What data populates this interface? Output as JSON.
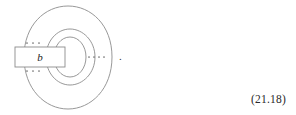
{
  "figure": {
    "kind": "knot-diagram",
    "box": {
      "label": "b",
      "dots_above": "· · ·",
      "dots_below": "· · ·"
    },
    "interior_dots": "· · · ·",
    "trailing_punctuation": ".",
    "loop_count": 3,
    "colors": {
      "background": "#ffffff",
      "stroke": "#8c8c8c",
      "box_fill": "#ffffff",
      "label_text": "#1a1a1a",
      "dot": "#6f6f6f",
      "equation_text": "#2a2a2a"
    }
  },
  "equation": {
    "number": "(21.18)"
  }
}
